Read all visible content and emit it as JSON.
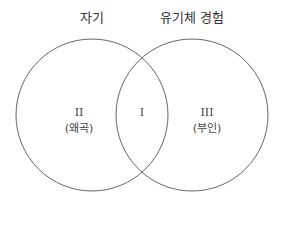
{
  "diagram": {
    "type": "venn",
    "sets": [
      {
        "title": "자기",
        "region_numeral": "II",
        "region_label": "(왜곡)"
      },
      {
        "title": "유기체 경험",
        "region_numeral": "III",
        "region_label": "(부인)"
      }
    ],
    "intersection": {
      "numeral": "I"
    },
    "stroke_color": "#666666"
  }
}
